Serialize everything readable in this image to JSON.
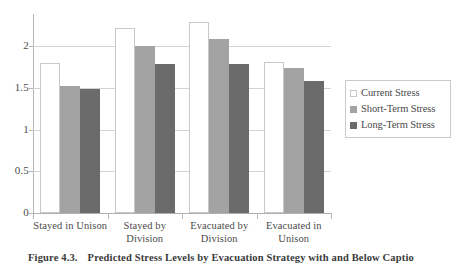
{
  "chart_data": {
    "type": "bar",
    "title": "",
    "subtitle": "",
    "xlabel": "",
    "ylabel": "",
    "ylim": [
      0,
      2.38
    ],
    "yticks": [
      0,
      0.5,
      1,
      1.5,
      2
    ],
    "ytick_labels": [
      "0",
      "0.5",
      "1",
      "1.5",
      "2"
    ],
    "grid": true,
    "grid_axis": "y",
    "legend_position": "right",
    "categories": [
      "Stayed in Unison",
      "Stayed by Division",
      "Evacuated by Division",
      "Evacuated in Unison"
    ],
    "category_lines": [
      [
        "Stayed in Unison"
      ],
      [
        "Stayed by",
        "Division"
      ],
      [
        "Evacuated by",
        "Division"
      ],
      [
        "Evacuated in",
        "Unison"
      ]
    ],
    "series": [
      {
        "name": "Current Stress",
        "color": "#ffffff",
        "border": "#c8c8c8",
        "values": [
          1.8,
          2.22,
          2.29,
          1.81
        ]
      },
      {
        "name": "Short-Term Stress",
        "color": "#a3a3a3",
        "border": "#a3a3a3",
        "values": [
          1.52,
          2.0,
          2.09,
          1.74
        ]
      },
      {
        "name": "Long-Term Stress",
        "color": "#6b6b6b",
        "border": "#6b6b6b",
        "values": [
          1.48,
          1.79,
          1.79,
          1.58
        ]
      }
    ]
  },
  "legend": {
    "items": [
      {
        "label": "Current Stress",
        "swatch": "legend-swatch-current-stress"
      },
      {
        "label": "Short-Term Stress",
        "swatch": "legend-swatch-short-term-stress"
      },
      {
        "label": "Long-Term Stress",
        "swatch": "legend-swatch-long-term-stress"
      }
    ]
  },
  "caption": {
    "number": "Figure 4.3.",
    "text": "Predicted Stress Levels by Evacuation Strategy with and Below Captio"
  }
}
